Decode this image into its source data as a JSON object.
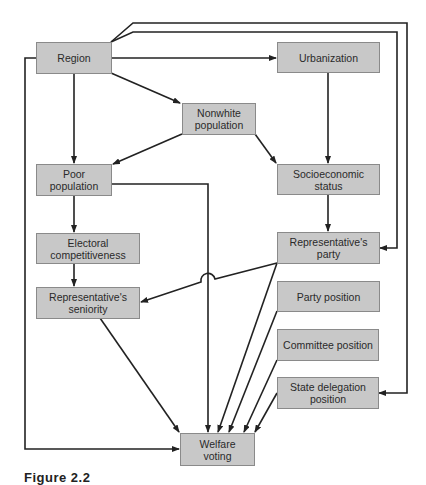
{
  "diagram": {
    "nodes": {
      "region": {
        "label": "Region"
      },
      "urbanization": {
        "label": "Urbanization"
      },
      "nonwhite": {
        "label": "Nonwhite\npopulation"
      },
      "poor": {
        "label": "Poor\npopulation"
      },
      "socioeconomic": {
        "label": "Socioeconomic\nstatus"
      },
      "electoral": {
        "label": "Electoral\ncompetitiveness"
      },
      "rep_party": {
        "label": "Representative's\nparty"
      },
      "seniority": {
        "label": "Representative's\nseniority"
      },
      "party_position": {
        "label": "Party position"
      },
      "committee_position": {
        "label": "Committee position"
      },
      "state_delegation": {
        "label": "State delegation\nposition"
      },
      "welfare": {
        "label": "Welfare\nvoting"
      }
    },
    "edges": [
      {
        "from": "Region",
        "to": "Urbanization"
      },
      {
        "from": "Region",
        "to": "Nonwhite population"
      },
      {
        "from": "Region",
        "to": "Poor population"
      },
      {
        "from": "Region",
        "to": "Representative's party"
      },
      {
        "from": "Region",
        "to": "State delegation position"
      },
      {
        "from": "Region",
        "to": "Welfare voting"
      },
      {
        "from": "Urbanization",
        "to": "Socioeconomic status"
      },
      {
        "from": "Nonwhite population",
        "to": "Poor population"
      },
      {
        "from": "Nonwhite population",
        "to": "Socioeconomic status"
      },
      {
        "from": "Poor population",
        "to": "Electoral competitiveness"
      },
      {
        "from": "Poor population",
        "to": "Welfare voting"
      },
      {
        "from": "Socioeconomic status",
        "to": "Representative's party"
      },
      {
        "from": "Electoral competitiveness",
        "to": "Representative's seniority"
      },
      {
        "from": "Representative's party",
        "to": "Representative's seniority"
      },
      {
        "from": "Representative's party",
        "to": "Welfare voting"
      },
      {
        "from": "Representative's seniority",
        "to": "Welfare voting"
      },
      {
        "from": "Party position",
        "to": "Welfare voting"
      },
      {
        "from": "Committee position",
        "to": "Welfare voting"
      },
      {
        "from": "State delegation position",
        "to": "Welfare voting"
      }
    ]
  },
  "caption": "Figure 2.2"
}
